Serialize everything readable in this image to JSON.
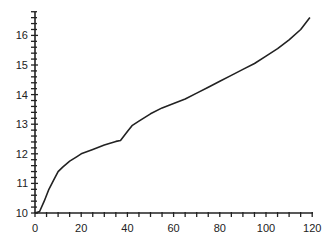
{
  "chart_data": {
    "type": "line",
    "title": "",
    "xlabel": "",
    "ylabel": "",
    "xlim": [
      0,
      120
    ],
    "ylim": [
      9.9,
      16.8
    ],
    "grid": false,
    "legend": null,
    "x_ticks": [
      0,
      20,
      40,
      60,
      80,
      100,
      120
    ],
    "y_ticks": [
      10,
      11,
      12,
      13,
      14,
      15,
      16
    ],
    "series": [
      {
        "name": "series-1",
        "color": "#222222",
        "x": [
          0,
          2,
          4,
          6,
          8,
          10,
          12,
          15,
          18,
          20,
          25,
          30,
          35,
          37,
          40,
          42,
          45,
          50,
          55,
          60,
          65,
          70,
          75,
          80,
          85,
          90,
          95,
          100,
          105,
          110,
          115,
          119
        ],
        "values": [
          10.0,
          10.05,
          10.4,
          10.8,
          11.1,
          11.4,
          11.55,
          11.75,
          11.9,
          12.0,
          12.15,
          12.3,
          12.42,
          12.45,
          12.75,
          12.95,
          13.1,
          13.35,
          13.55,
          13.7,
          13.85,
          14.05,
          14.25,
          14.45,
          14.65,
          14.85,
          15.05,
          15.3,
          15.55,
          15.85,
          16.2,
          16.6
        ]
      }
    ]
  }
}
